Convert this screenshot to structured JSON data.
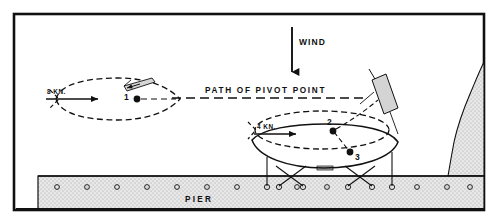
{
  "figure": {
    "kind": "nautical-maneuvering-diagram",
    "frame": {
      "x": 14,
      "y": 14,
      "width": 470,
      "height": 196,
      "stroke": "#000000",
      "stroke_width": 2.4
    },
    "background": "#ffffff",
    "ink": "#111111"
  },
  "labels": {
    "wind": "WIND",
    "path_of_pivot_point": "PATH OF PIVOT POINT",
    "speed_approach": "8 KN.",
    "speed_turning": "4 KN.",
    "pier": "PIER",
    "pivot_1": "1",
    "pivot_2": "2",
    "pivot_3": "3"
  },
  "wind_arrow": {
    "direction": "down",
    "x": 292,
    "y_start": 27,
    "y_end": 80,
    "label_x": 299,
    "label_y": 44,
    "font_size": 8.5
  },
  "path_line": {
    "y": 98,
    "x_start": 172,
    "x_end": 370,
    "style": "dashed",
    "dash": "9,5",
    "label_x": 205,
    "label_y": 91,
    "font_size": 8.2,
    "letter_spacing": 1.6
  },
  "ships": [
    {
      "id": "ship-approaching",
      "style": "dashed",
      "cx": 118,
      "cy": 99,
      "rx": 62,
      "ry": 21,
      "heading": "bow-right",
      "pivot": {
        "label": "1",
        "x": 137,
        "y": 99,
        "label_x": 125,
        "label_y": 94
      },
      "speed_label": "8 KN.",
      "speed_label_x": 47,
      "speed_label_y": 92,
      "speed_arrow": {
        "x1": 46,
        "y1": 99,
        "x2": 100,
        "y2": 99
      }
    },
    {
      "id": "ship-turning-dashed",
      "style": "dashed",
      "cx": 322,
      "cy": 130,
      "rx": 66,
      "ry": 19,
      "pivot": {
        "label": "2",
        "x": 333,
        "y": 131,
        "label_x": 320,
        "label_y": 126
      },
      "speed_label": "4 KN.",
      "speed_label_x": 256,
      "speed_label_y": 127,
      "speed_arrow": {
        "x1": 254,
        "y1": 134,
        "x2": 296,
        "y2": 134
      }
    },
    {
      "id": "ship-alongside-solid",
      "style": "solid",
      "cx": 325,
      "cy": 148,
      "rx": 73,
      "ry": 21,
      "pivot": {
        "label": "3",
        "x": 350,
        "y": 152,
        "label_x": 354,
        "label_y": 160
      }
    }
  ],
  "tugs": [
    {
      "id": "tug-stern-approach",
      "x": 133,
      "y": 84,
      "angle": -28,
      "length": 22,
      "width": 7
    },
    {
      "id": "tug-quarter-turning",
      "x": 383,
      "y": 98,
      "angle": 52,
      "length": 34,
      "width": 11
    }
  ],
  "pier": {
    "label": "PIER",
    "label_x": 185,
    "label_y": 200,
    "font_size": 8.2,
    "letter_spacing": 2.2,
    "x": 38,
    "y": 176,
    "width": 446,
    "height": 34,
    "fill": "#e3e3e3",
    "stroke": "#000000",
    "bollards": [
      57,
      87,
      117,
      147,
      177,
      207,
      237,
      267,
      297,
      327,
      357,
      387,
      417,
      447,
      470
    ],
    "bollard_radius": 2.4,
    "bollard_y": 187
  },
  "mooring": {
    "breast_lines": [
      {
        "x1": 267,
        "y1": 158,
        "x2": 267,
        "y2": 186
      },
      {
        "x1": 392,
        "y1": 154,
        "x2": 392,
        "y2": 186
      }
    ],
    "spring_lines": [
      {
        "x1": 276,
        "y1": 168,
        "x2": 302,
        "y2": 187
      },
      {
        "x1": 305,
        "y1": 168,
        "x2": 279,
        "y2": 187
      },
      {
        "x1": 345,
        "y1": 168,
        "x2": 371,
        "y2": 187
      },
      {
        "x1": 374,
        "y1": 168,
        "x2": 348,
        "y2": 187
      }
    ],
    "fender_x": 317,
    "fender_y": 168,
    "fender_w": 16,
    "fender_h": 4
  },
  "shoreline": {
    "fill": "#e3e3e3",
    "stroke": "#000000",
    "points": "484,64 478,76 470,92 462,110 456,130 452,150 448,166 446,176 484,176"
  },
  "colors": {
    "ink": "#111111",
    "pier_fill": "#e3e3e3",
    "land_fill": "#e3e3e3",
    "white": "#ffffff"
  }
}
